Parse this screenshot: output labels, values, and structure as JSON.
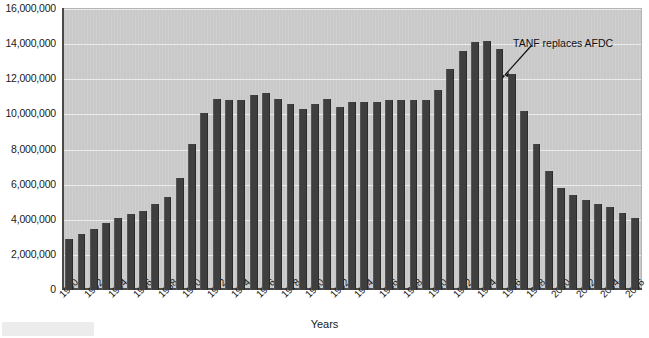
{
  "chart_data": {
    "type": "bar",
    "title": "",
    "xlabel": "Years",
    "ylabel": "",
    "ylim": [
      0,
      16000000
    ],
    "grid": true,
    "legend": "none",
    "y_ticks": [
      0,
      2000000,
      4000000,
      6000000,
      8000000,
      10000000,
      12000000,
      14000000,
      16000000
    ],
    "y_tick_labels": [
      "0",
      "2,000,000",
      "4,000,000",
      "6,000,000",
      "8,000,000",
      "10,000,000",
      "12,000,000",
      "14,000,000",
      "16,000,000"
    ],
    "x_tick_labels": [
      "1960",
      "1962",
      "1964",
      "1966",
      "1968",
      "1970",
      "1972",
      "1974",
      "1976",
      "1978",
      "1980",
      "1982",
      "1984",
      "1986",
      "1988",
      "1990",
      "1992",
      "1994",
      "1996",
      "1998",
      "2000",
      "2002",
      "2004",
      "2006"
    ],
    "categories": [
      "1960",
      "1961",
      "1962",
      "1963",
      "1964",
      "1965",
      "1966",
      "1967",
      "1968",
      "1969",
      "1970",
      "1971",
      "1972",
      "1973",
      "1974",
      "1975",
      "1976",
      "1977",
      "1978",
      "1979",
      "1980",
      "1981",
      "1982",
      "1983",
      "1984",
      "1985",
      "1986",
      "1987",
      "1988",
      "1989",
      "1990",
      "1991",
      "1992",
      "1993",
      "1994",
      "1995",
      "1996",
      "1997",
      "1998",
      "1999",
      "2000",
      "2001",
      "2002",
      "2003",
      "2004",
      "2005",
      "2006"
    ],
    "values": [
      2900000,
      3200000,
      3500000,
      3800000,
      4100000,
      4300000,
      4500000,
      4900000,
      5300000,
      6400000,
      8300000,
      10100000,
      10900000,
      10800000,
      10800000,
      11100000,
      11200000,
      10900000,
      10600000,
      10300000,
      10600000,
      10900000,
      10400000,
      10700000,
      10700000,
      10700000,
      10800000,
      10800000,
      10800000,
      10800000,
      11400000,
      12600000,
      13600000,
      14100000,
      14200000,
      13700000,
      12300000,
      10200000,
      8300000,
      6800000,
      5800000,
      5400000,
      5100000,
      4900000,
      4700000,
      4400000,
      4100000
    ],
    "annotations": [
      {
        "text": "TANF replaces AFDC",
        "points_to_category": "1996"
      }
    ],
    "colors": {
      "bar": "#3f3f3f",
      "plot_background": "#c9c9c9",
      "gridline": "#eceaea",
      "axis": "#4a4a4a",
      "text": "#1a1a1a",
      "page_background": "#ffffff"
    }
  }
}
